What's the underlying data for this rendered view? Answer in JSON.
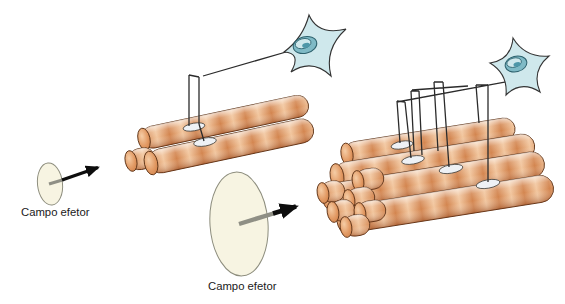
{
  "diagram": {
    "type": "anatomy-illustration",
    "labels": {
      "left_field": "Campo efetor",
      "right_field": "Campo efetor"
    },
    "motor_units": {
      "small": {
        "field_label": "Campo efetor",
        "neurons": 1,
        "visible_muscle_fibers": 3,
        "endplates": 2,
        "field_size": "small"
      },
      "large": {
        "field_label": "Campo efetor",
        "neurons": 1,
        "visible_muscle_fibers": 10,
        "endplates": 4,
        "field_size": "large"
      }
    },
    "colors": {
      "background": "#ffffff",
      "fiber_light": "#f4cba0",
      "fiber_base": "#e3975f",
      "fiber_dark": "#c4703c",
      "fiber_outline": "#5e3317",
      "neuron_fill": "#cfe8ec",
      "neuron_nucleus": "#67aebc",
      "endplate_fill": "#eef1f5",
      "field_fill": "#f7f4e2",
      "field_outline": "#8d8d7d",
      "axon_line": "#2b2b2b",
      "arrow": "#0d0d0d",
      "label_text": "#1a1a1a"
    }
  }
}
